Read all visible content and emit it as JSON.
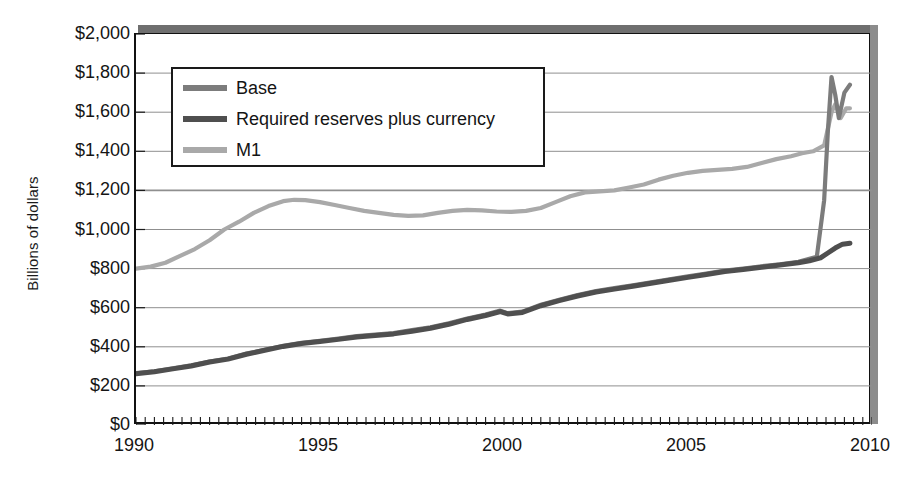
{
  "chart_data": {
    "type": "line",
    "title": "",
    "xlabel": "",
    "ylabel": "Billions of dollars",
    "xlim": [
      1990,
      2010
    ],
    "ylim": [
      0,
      2000
    ],
    "grid": true,
    "legend_position": "top-left",
    "y_ticks": [
      "$0",
      "$200",
      "$400",
      "$600",
      "$800",
      "$1,000",
      "$1,200",
      "$1,400",
      "$1,600",
      "$1,800",
      "$2,000"
    ],
    "y_tick_values": [
      0,
      200,
      400,
      600,
      800,
      1000,
      1200,
      1400,
      1600,
      1800,
      2000
    ],
    "x_ticks": [
      "1990",
      "1995",
      "2000",
      "2005",
      "2010"
    ],
    "x_tick_values": [
      1990,
      1995,
      2000,
      2005,
      2010
    ],
    "x_minor_tick_interval": 0.25,
    "series": [
      {
        "name": "Base",
        "color": "#7c7c7c",
        "x": [
          1990.0,
          1990.5,
          1991.0,
          1991.5,
          1992.0,
          1992.5,
          1993.0,
          1993.5,
          1994.0,
          1994.5,
          1995.0,
          1995.5,
          1996.0,
          1996.5,
          1997.0,
          1997.5,
          1998.0,
          1998.5,
          1999.0,
          1999.5,
          1999.9,
          2000.1,
          2000.5,
          2001.0,
          2001.5,
          2002.0,
          2002.5,
          2003.0,
          2003.5,
          2004.0,
          2004.5,
          2005.0,
          2005.5,
          2006.0,
          2006.5,
          2007.0,
          2007.5,
          2008.0,
          2008.5,
          2008.7,
          2008.8,
          2008.9,
          2009.0,
          2009.1,
          2009.25,
          2009.4
        ],
        "y": [
          265,
          275,
          290,
          305,
          325,
          340,
          365,
          385,
          405,
          420,
          430,
          442,
          455,
          462,
          470,
          485,
          500,
          520,
          545,
          565,
          585,
          572,
          580,
          615,
          640,
          665,
          685,
          700,
          715,
          730,
          745,
          760,
          775,
          790,
          800,
          812,
          822,
          835,
          860,
          1150,
          1500,
          1780,
          1690,
          1570,
          1700,
          1740
        ]
      },
      {
        "name": "Required reserves plus currency",
        "color": "#4f4f4f",
        "x": [
          1990.0,
          1990.5,
          1991.0,
          1991.5,
          1992.0,
          1992.5,
          1993.0,
          1993.5,
          1994.0,
          1994.5,
          1995.0,
          1995.5,
          1996.0,
          1996.5,
          1997.0,
          1997.5,
          1998.0,
          1998.5,
          1999.0,
          1999.5,
          1999.9,
          2000.1,
          2000.5,
          2001.0,
          2001.5,
          2002.0,
          2002.5,
          2003.0,
          2003.5,
          2004.0,
          2004.5,
          2005.0,
          2005.5,
          2006.0,
          2006.5,
          2007.0,
          2007.5,
          2008.0,
          2008.3,
          2008.6,
          2008.8,
          2009.0,
          2009.2,
          2009.4
        ],
        "y": [
          262,
          272,
          287,
          302,
          322,
          337,
          362,
          382,
          402,
          417,
          427,
          438,
          450,
          458,
          466,
          480,
          495,
          515,
          540,
          560,
          580,
          568,
          576,
          610,
          636,
          660,
          680,
          695,
          710,
          725,
          740,
          755,
          770,
          785,
          795,
          807,
          818,
          830,
          840,
          855,
          880,
          905,
          925,
          930
        ]
      },
      {
        "name": "M1",
        "color": "#a9a9a9",
        "x": [
          1990.0,
          1990.4,
          1990.8,
          1991.2,
          1991.6,
          1992.0,
          1992.4,
          1992.8,
          1993.2,
          1993.6,
          1994.0,
          1994.3,
          1994.6,
          1995.0,
          1995.4,
          1995.8,
          1996.2,
          1996.6,
          1997.0,
          1997.4,
          1997.8,
          1998.2,
          1998.6,
          1999.0,
          1999.4,
          1999.8,
          2000.2,
          2000.6,
          2001.0,
          2001.4,
          2001.8,
          2002.2,
          2002.6,
          2003.0,
          2003.4,
          2003.8,
          2004.2,
          2004.6,
          2005.0,
          2005.4,
          2005.8,
          2006.2,
          2006.6,
          2007.0,
          2007.4,
          2007.8,
          2008.1,
          2008.4,
          2008.7,
          2008.9,
          2009.0,
          2009.15,
          2009.3,
          2009.4
        ],
        "y": [
          800,
          810,
          830,
          865,
          900,
          945,
          1000,
          1040,
          1085,
          1120,
          1145,
          1152,
          1150,
          1140,
          1125,
          1110,
          1095,
          1085,
          1075,
          1070,
          1072,
          1085,
          1095,
          1100,
          1098,
          1092,
          1090,
          1095,
          1110,
          1140,
          1170,
          1190,
          1195,
          1200,
          1215,
          1230,
          1255,
          1275,
          1290,
          1300,
          1305,
          1310,
          1320,
          1340,
          1360,
          1375,
          1390,
          1400,
          1430,
          1600,
          1640,
          1570,
          1620,
          1620
        ]
      }
    ],
    "legend_entries": [
      {
        "label": "Base",
        "color": "#7c7c7c"
      },
      {
        "label": "Required reserves plus currency",
        "color": "#4f4f4f"
      },
      {
        "label": "M1",
        "color": "#a9a9a9"
      }
    ]
  },
  "axis": {
    "y_title": "Billions of dollars"
  },
  "colors": {
    "grid": "#8f8f8f",
    "frame": "#111111",
    "shadow_top": "#6f6f6f",
    "shadow_right": "#8c8c8c",
    "background": "#ffffff"
  }
}
